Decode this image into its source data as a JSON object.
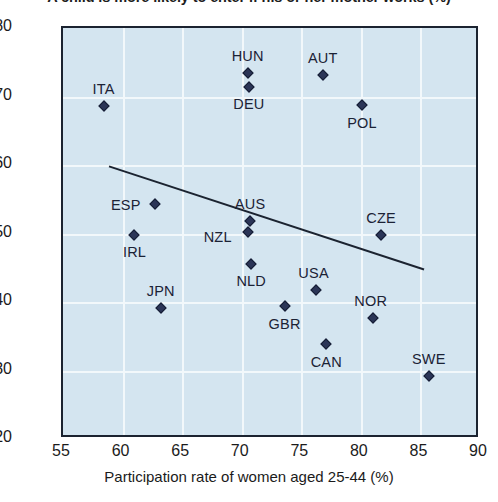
{
  "chart_data": {
    "type": "scatter",
    "title": "A child is more likely to enter if his or her mother works (%)",
    "xlabel": "Participation rate of women aged 25-44 (%)",
    "ylabel": "",
    "xlim": [
      55,
      90
    ],
    "ylim": [
      20,
      80
    ],
    "xticks": [
      55,
      60,
      65,
      70,
      75,
      80,
      85,
      90
    ],
    "yticks": [
      20,
      30,
      40,
      50,
      60,
      70,
      80
    ],
    "grid": true,
    "legend": "none",
    "background_color": "#d4e5f0",
    "gridline_color": "#f2f8fb",
    "marker_color": "#2b3557",
    "trendline_color": "#1b2330",
    "points": [
      {
        "label": "ITA",
        "x": 58.4,
        "y": 68.6,
        "label_dx": 0,
        "label_dy": -17
      },
      {
        "label": "IRL",
        "x": 61.0,
        "y": 49.8,
        "label_dx": 0,
        "label_dy": 17
      },
      {
        "label": "ESP",
        "x": 62.7,
        "y": 54.3,
        "label_dx": -29,
        "label_dy": 1
      },
      {
        "label": "JPN",
        "x": 63.2,
        "y": 39.1,
        "label_dx": 0,
        "label_dy": -17
      },
      {
        "label": "HUN",
        "x": 70.5,
        "y": 73.4,
        "label_dx": 0,
        "label_dy": -17
      },
      {
        "label": "DEU",
        "x": 70.6,
        "y": 71.4,
        "label_dx": 0,
        "label_dy": 17
      },
      {
        "label": "AUS",
        "x": 70.7,
        "y": 51.8,
        "label_dx": 0,
        "label_dy": -17
      },
      {
        "label": "NZL",
        "x": 70.5,
        "y": 50.2,
        "label_dx": -30,
        "label_dy": 5
      },
      {
        "label": "NLD",
        "x": 70.8,
        "y": 45.5,
        "label_dx": 0,
        "label_dy": 17
      },
      {
        "label": "GBR",
        "x": 73.6,
        "y": 39.4,
        "label_dx": 0,
        "label_dy": 18
      },
      {
        "label": "USA",
        "x": 76.2,
        "y": 41.7,
        "label_dx": -2,
        "label_dy": -17
      },
      {
        "label": "AUT",
        "x": 76.8,
        "y": 73.2,
        "label_dx": 0,
        "label_dy": -17
      },
      {
        "label": "CAN",
        "x": 77.1,
        "y": 33.8,
        "label_dx": 0,
        "label_dy": 18
      },
      {
        "label": "POL",
        "x": 80.1,
        "y": 68.7,
        "label_dx": 0,
        "label_dy": 18
      },
      {
        "label": "NOR",
        "x": 81.0,
        "y": 37.7,
        "label_dx": -2,
        "label_dy": -17
      },
      {
        "label": "CZE",
        "x": 81.7,
        "y": 49.8,
        "label_dx": 0,
        "label_dy": -17
      },
      {
        "label": "SWE",
        "x": 85.7,
        "y": 29.2,
        "label_dx": 0,
        "label_dy": -17
      }
    ],
    "trendline": {
      "x0": 58.9,
      "y0": 59.6,
      "x1": 85.6,
      "y1": 44.4
    }
  }
}
